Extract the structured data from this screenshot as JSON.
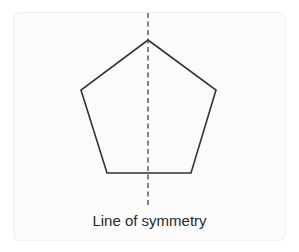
{
  "diagram": {
    "shape": "regular-pentagon",
    "caption": "Line of symmetry",
    "stroke_color": "#333333",
    "axis_color": "#444444",
    "background": "#fbfbfb",
    "vertices": [
      [
        148,
        40
      ],
      [
        216,
        90
      ],
      [
        191,
        173
      ],
      [
        107,
        173
      ],
      [
        81,
        90
      ]
    ],
    "axis": {
      "x": 148,
      "y1": 13,
      "y2": 208
    }
  }
}
